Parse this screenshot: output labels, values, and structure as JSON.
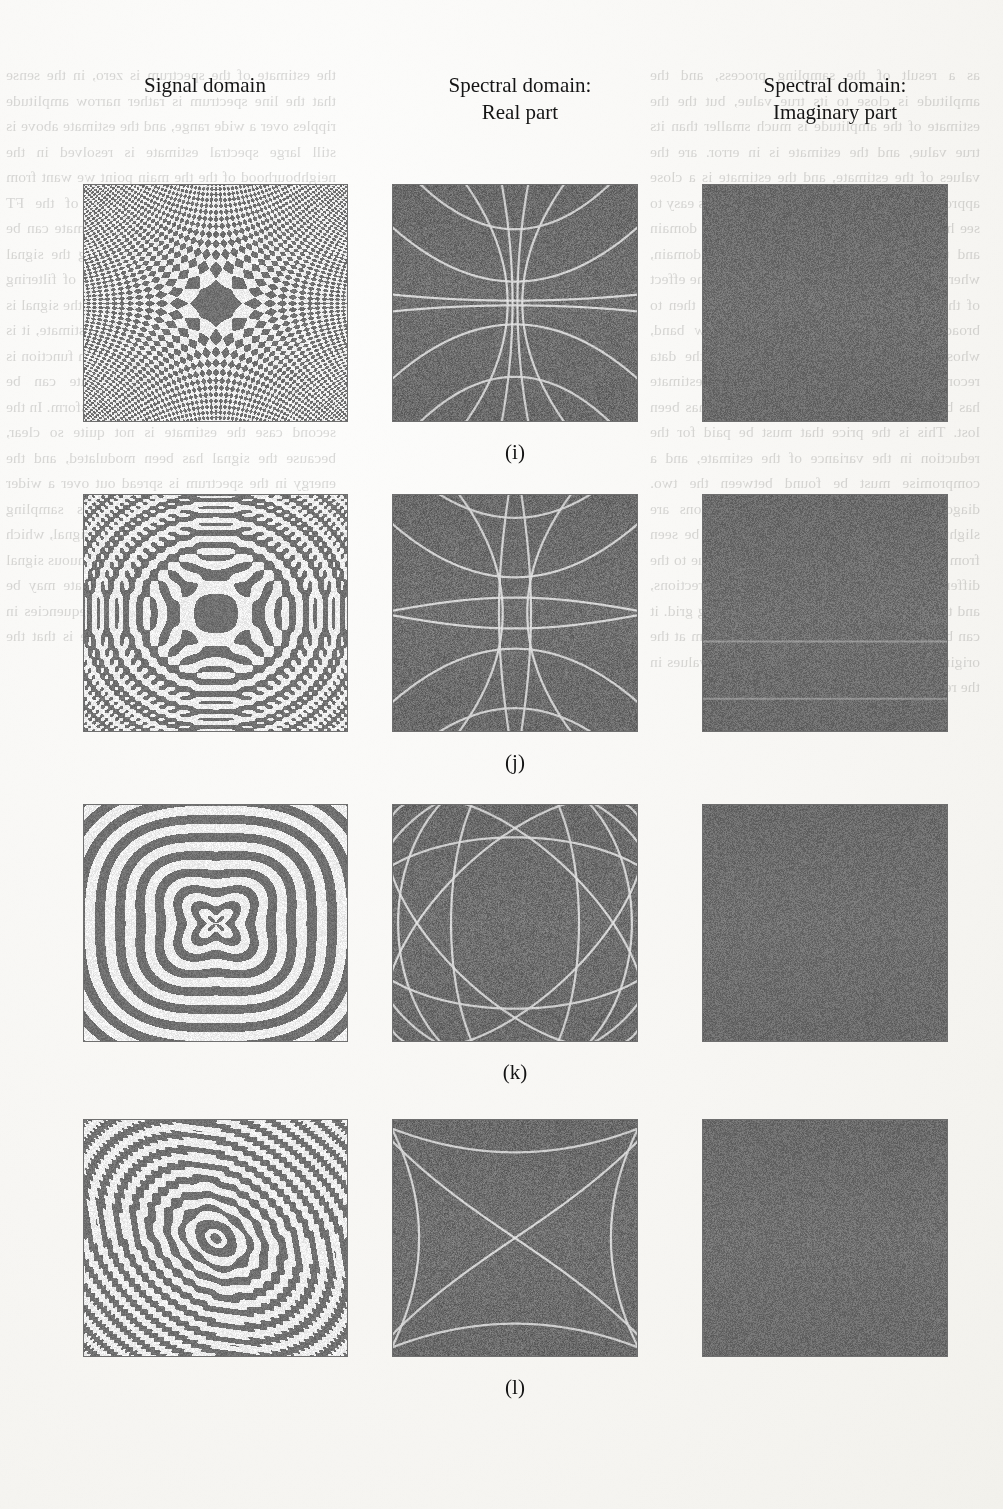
{
  "page": {
    "width": 1003,
    "height": 1509,
    "background": "#f7f6f3",
    "scan_type": "book-page-scan-with-showthrough"
  },
  "columns": [
    {
      "id": "signal",
      "title_line1": "Signal domain",
      "title_line2": ""
    },
    {
      "id": "real",
      "title_line1": "Spectral domain:",
      "title_line2": "Real part"
    },
    {
      "id": "imaginary",
      "title_line1": "Spectral domain:",
      "title_line2": "Imaginary part"
    }
  ],
  "rows": [
    {
      "label": "(i)"
    },
    {
      "label": "(j)"
    },
    {
      "label": "(k)"
    },
    {
      "label": "(l)"
    }
  ],
  "axes": {
    "signal": {
      "y_top": "8.",
      "y_mid": "0",
      "y_bot": "-8.",
      "x_left": "-8.",
      "x_mid": "0",
      "x_right": "8."
    },
    "spectral": {
      "y_top": "4.",
      "y_mid": "0",
      "y_bot": "-4.",
      "x_left": "-4.",
      "x_mid": "0",
      "x_right": "4."
    }
  },
  "colors": {
    "signal_background": "#f3f2ee",
    "signal_ink": "#6e6e6e",
    "spectral_background": "#6f6f6f",
    "spectral_curve": "#dedede",
    "frame": "#6f6f6f",
    "text": "#141414"
  },
  "chart_data": {
    "type": "heatmap",
    "layout": {
      "rows": 4,
      "cols": 3,
      "grid": false,
      "legend": null
    },
    "panels": [
      {
        "row": "(i)",
        "column": "signal",
        "xlabel": "",
        "ylabel": "",
        "xlim": [
          -8,
          8
        ],
        "ylim": [
          -8,
          8
        ],
        "xticks": [
          "-8.",
          "0",
          "8."
        ],
        "yticks": [
          "-8.",
          "0",
          "8."
        ],
        "pattern": "cross-chirp",
        "description": "Binary-thresholded interference fringes forming a four-armed cross through the origin; fringe density increases away from the axes",
        "params": {
          "kind": "cross",
          "freq": 26,
          "power": 1.0,
          "armWidth": 0.55,
          "threshold": 0.0
        }
      },
      {
        "row": "(i)",
        "column": "real",
        "xlim": [
          -4,
          4
        ],
        "ylim": [
          -4,
          4
        ],
        "xticks": [
          "-4.",
          "0",
          "4."
        ],
        "yticks": [
          "-4.",
          "0",
          "4."
        ],
        "pattern": "hyperbolic-arcs",
        "description": "Uniform mid-grey field crossed by bright hyperbola-like arcs, symmetric about both axes, pinching toward the vertical centre line",
        "params": {
          "kind": "hyperbola",
          "count": 4,
          "scale": 1.0
        }
      },
      {
        "row": "(i)",
        "column": "imaginary",
        "xlim": [
          -4,
          4
        ],
        "ylim": [
          -4,
          4
        ],
        "xticks": [
          "-4.",
          "0",
          "4."
        ],
        "yticks": [
          "-4.",
          "0",
          "4."
        ],
        "pattern": "flat-zero",
        "description": "Essentially uniform mid-grey: imaginary part is zero everywhere",
        "params": {
          "kind": "flat"
        }
      },
      {
        "row": "(j)",
        "column": "signal",
        "xlim": [
          -8,
          8
        ],
        "ylim": [
          -8,
          8
        ],
        "xticks": [
          "-8.",
          "0",
          "8."
        ],
        "yticks": [
          "-8.",
          "0",
          "8."
        ],
        "pattern": "lobed-cross",
        "description": "Thresholded fringes forming large dark lobes along the vertical and horizontal axes, with fine ripples filling the quadrants",
        "params": {
          "kind": "lobecross",
          "freq": 20,
          "lobe": 2.1
        }
      },
      {
        "row": "(j)",
        "column": "real",
        "xlim": [
          -4,
          4
        ],
        "ylim": [
          -4,
          4
        ],
        "xticks": [
          "-4.",
          "0",
          "4."
        ],
        "yticks": [
          "-4.",
          "0",
          "4."
        ],
        "pattern": "lens-and-arcs",
        "description": "Mid-grey field with bright arcs forming a vertical lens through the origin and broad horizontal arcs above and below",
        "params": {
          "kind": "lens",
          "count": 4
        }
      },
      {
        "row": "(j)",
        "column": "imaginary",
        "xlim": [
          -4,
          4
        ],
        "ylim": [
          -4,
          4
        ],
        "xticks": [
          "-4.",
          "0",
          "4."
        ],
        "yticks": [
          "-4.",
          "0",
          "4."
        ],
        "pattern": "flat-zero",
        "description": "Essentially uniform mid-grey with one faint horizontal scan streak",
        "params": {
          "kind": "flat",
          "streak": true
        }
      },
      {
        "row": "(k)",
        "column": "signal",
        "xlim": [
          -8,
          8
        ],
        "ylim": [
          -8,
          8
        ],
        "xticks": [
          "-8.",
          "0",
          "8."
        ],
        "yticks": [
          "-8.",
          "0",
          "8."
        ],
        "pattern": "radial-ripples",
        "description": "Dense concentric ripple rings emanating from the origin, bending into petal shapes in each quadrant",
        "params": {
          "kind": "ripple",
          "freq": 17,
          "petal": 4
        }
      },
      {
        "row": "(k)",
        "column": "real",
        "xlim": [
          -4,
          4
        ],
        "ylim": [
          -4,
          4
        ],
        "xticks": [
          "-4.",
          "0",
          "4."
        ],
        "yticks": [
          "-4.",
          "0",
          "4."
        ],
        "pattern": "rosette",
        "description": "Mid-grey field with bright intersecting ellipses and arcs forming an eight-pointed rosette / star pattern centred on the origin",
        "params": {
          "kind": "rosette",
          "count": 6
        }
      },
      {
        "row": "(k)",
        "column": "imaginary",
        "xlim": [
          -4,
          4
        ],
        "ylim": [
          -4,
          4
        ],
        "xticks": [
          "-4.",
          "0",
          "4."
        ],
        "yticks": [
          "-4.",
          "0",
          "4."
        ],
        "pattern": "flat-zero",
        "description": "Essentially uniform mid-grey: imaginary part is zero everywhere",
        "params": {
          "kind": "flat"
        }
      },
      {
        "row": "(l)",
        "column": "signal",
        "xlim": [
          -8,
          8
        ],
        "ylim": [
          -8,
          8
        ],
        "xticks": [
          "-8.",
          "0",
          "8."
        ],
        "yticks": [
          "-8.",
          "0",
          "8."
        ],
        "pattern": "chevron-burst",
        "description": "Ripples from the origin with four large dark arrow/chevron wedges pointing toward the diagonal corners",
        "params": {
          "kind": "chevron",
          "freq": 22
        }
      },
      {
        "row": "(l)",
        "column": "real",
        "xlim": [
          -4,
          4
        ],
        "ylim": [
          -4,
          4
        ],
        "xticks": [
          "-4.",
          "0",
          "4."
        ],
        "yticks": [
          "-4.",
          "0",
          "4."
        ],
        "pattern": "crossing-arcs",
        "description": "Mid-grey field with two broad bright arcs crossing in an X at the centre plus shallow arcs near the top and bottom edges",
        "params": {
          "kind": "xarcs",
          "count": 4
        }
      },
      {
        "row": "(l)",
        "column": "imaginary",
        "xlim": [
          -4,
          4
        ],
        "ylim": [
          -4,
          4
        ],
        "xticks": [
          "-4.",
          "0",
          "4."
        ],
        "yticks": [
          "-4.",
          "0",
          "4."
        ],
        "pattern": "flat-zero",
        "description": "Essentially uniform mid-grey: imaginary part is zero everywhere",
        "params": {
          "kind": "flat"
        }
      }
    ]
  },
  "showthrough": {
    "note": "faint mirrored text bleeding through from the reverse side of the page",
    "left_lines": [
      "the estimate of the spectrum is zero, in the",
      "sense that the line spectrum is rather narrow",
      "amplitude ripples over a wide range, and",
      "the estimate above is still large",
      "spectral estimate is resolved",
      "in the neighbourhood of the",
      "the main point we want from the estimate",
      "passed from one side of the FT spectrum",
      "to the other, the spectral estimate can be",
      "used for the purpose of reconstructing the",
      "signal from its spectrum, and for the",
      "purpose of filtering the signal in the",
      "spectral domain, when the signal is",
      "when the input magnitude is uniform",
      "estimate, it is clear that the signal amount of the given function is no longer",
      "present, and the estimate can be recovered",
      "by the use of the inverse transform. In the",
      "second case the estimate is not quite so",
      "clear, because the signal has been",
      "modulated, and the energy in the spectrum",
      "is spread out over a wider band.",
      "for general",
      "two-axes patterns",
      "sampling frequency along",
      "the spectrum and the signal, which",
      "is the same as the sampling of the",
      "continuous signal in the spectral",
      "domain, and the estimate may be",
      "resolved into its components.",
      "based frequencies in the signal",
      "components which therefore is that the",
      "non applying the method of analysis"
    ],
    "right_lines": [
      "as a result of the sampling process, and the",
      "amplitude is close to its true value, but the",
      "the estimate of the amplitude is much",
      "smaller than its true value, and the",
      "estimate is in error.",
      "are the values of the estimate, and",
      "the estimate is a close approximation",
      "to the true spectrum.",
      "above is easy to see how it can be",
      "derived in the frequency domain and",
      "then transformed back to the signal",
      "domain, where it appears as a simple",
      "convolution. The effect of the window",
      "function on the estimate is then",
      "to broaden each spectral line into a",
      "narrow band, whose width depends",
      "on the length of the data record.",
      "is no longer present, because",
      "the estimate has been smoothed and",
      "the fine structure has been lost.",
      "This is the price that must be paid",
      "for the reduction in the variance of",
      "the estimate, and a compromise must",
      "be found between the two.",
      "diagonals in the image, and the",
      "directions are slightly different",
      "in the two cases, as can be seen",
      "from the figures above. The",
      "difference is due to the different",
      "sampling rates used in the two",
      "directions, and the resulting",
      "anisotropy of the sampling grid.",
      "it can be found from the",
      "value of the spectrum at the",
      "origin, which is the sum of all",
      "the sample values in the record."
    ]
  }
}
